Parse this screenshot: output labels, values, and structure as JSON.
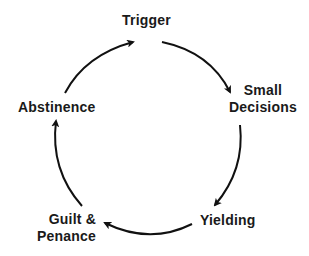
{
  "diagram": {
    "type": "cycle",
    "stroke_color": "#111111",
    "text_color": "#1a1a1a",
    "background": "#ffffff",
    "nodes": [
      {
        "id": "trigger",
        "label": "Trigger"
      },
      {
        "id": "small-decisions",
        "label_line1": "Small",
        "label_line2": "Decisions"
      },
      {
        "id": "yielding",
        "label": "Yielding"
      },
      {
        "id": "guilt-penance",
        "label_line1": "Guilt &",
        "label_line2": "Penance"
      },
      {
        "id": "abstinence",
        "label": "Abstinence"
      }
    ],
    "edges": [
      {
        "from": "abstinence",
        "to": "trigger"
      },
      {
        "from": "trigger",
        "to": "small-decisions"
      },
      {
        "from": "small-decisions",
        "to": "yielding"
      },
      {
        "from": "yielding",
        "to": "guilt-penance"
      },
      {
        "from": "guilt-penance",
        "to": "abstinence"
      }
    ]
  }
}
